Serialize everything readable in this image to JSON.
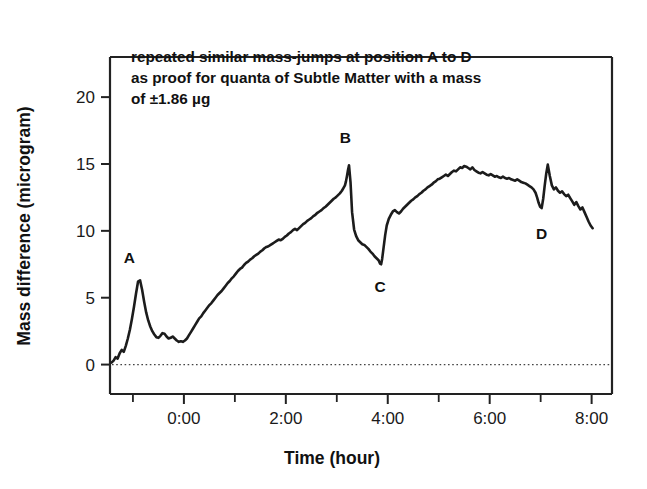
{
  "chart_data": {
    "type": "line",
    "title": "",
    "xlabel": "Time (hour)",
    "ylabel": "Mass difference (microgram)",
    "xlim": [
      -1.45,
      8.4
    ],
    "ylim": [
      -2.2,
      23.0
    ],
    "xticks": [
      0,
      1,
      2,
      3,
      4,
      5,
      6,
      7,
      8
    ],
    "xticklabels": [
      "0:00",
      "",
      "2:00",
      "",
      "4:00",
      "",
      "6:00",
      "",
      "8:00"
    ],
    "yticks": [
      0,
      5,
      10,
      15,
      20
    ],
    "yticklabels": [
      "0",
      "5",
      "10",
      "15",
      "20"
    ],
    "grid": false,
    "legend": "none",
    "zero_reference_line": 0,
    "annotations": [
      {
        "name": "note-line-1",
        "text": "repeated similar mass-jumps at position A to D"
      },
      {
        "name": "note-line-2",
        "text": "as proof for quanta of Subtle Matter with a mass"
      },
      {
        "name": "note-line-3",
        "text": "of ±1.86 µg"
      }
    ],
    "point_labels": [
      {
        "label": "A",
        "x": -1.07,
        "y": 7.6
      },
      {
        "label": "B",
        "x": 3.17,
        "y": 16.6
      },
      {
        "label": "C",
        "x": 3.85,
        "y": 5.4
      },
      {
        "label": "D",
        "x": 7.02,
        "y": 9.4
      }
    ],
    "series": [
      {
        "name": "mass difference",
        "x": [
          -1.42,
          -1.38,
          -1.34,
          -1.3,
          -1.26,
          -1.22,
          -1.18,
          -1.14,
          -1.1,
          -1.06,
          -1.02,
          -0.98,
          -0.94,
          -0.9,
          -0.86,
          -0.82,
          -0.78,
          -0.74,
          -0.7,
          -0.66,
          -0.62,
          -0.58,
          -0.54,
          -0.5,
          -0.46,
          -0.42,
          -0.38,
          -0.34,
          -0.3,
          -0.26,
          -0.22,
          -0.18,
          -0.14,
          -0.1,
          -0.06,
          -0.02,
          0.02,
          0.06,
          0.1,
          0.14,
          0.18,
          0.22,
          0.26,
          0.3,
          0.34,
          0.38,
          0.42,
          0.46,
          0.5,
          0.54,
          0.58,
          0.62,
          0.66,
          0.7,
          0.74,
          0.78,
          0.82,
          0.86,
          0.9,
          0.94,
          0.98,
          1.02,
          1.06,
          1.1,
          1.14,
          1.18,
          1.22,
          1.26,
          1.3,
          1.34,
          1.38,
          1.42,
          1.46,
          1.5,
          1.54,
          1.58,
          1.62,
          1.66,
          1.7,
          1.74,
          1.78,
          1.82,
          1.86,
          1.9,
          1.94,
          1.98,
          2.02,
          2.06,
          2.1,
          2.14,
          2.18,
          2.22,
          2.26,
          2.3,
          2.34,
          2.38,
          2.42,
          2.46,
          2.5,
          2.54,
          2.58,
          2.62,
          2.66,
          2.7,
          2.74,
          2.78,
          2.82,
          2.86,
          2.9,
          2.94,
          2.98,
          3.02,
          3.06,
          3.1,
          3.13,
          3.16,
          3.18,
          3.2,
          3.22,
          3.24,
          3.27,
          3.3,
          3.34,
          3.38,
          3.42,
          3.46,
          3.5,
          3.54,
          3.58,
          3.62,
          3.66,
          3.7,
          3.74,
          3.78,
          3.82,
          3.85,
          3.87,
          3.89,
          3.92,
          3.95,
          3.98,
          4.02,
          4.06,
          4.1,
          4.14,
          4.18,
          4.22,
          4.26,
          4.3,
          4.34,
          4.38,
          4.42,
          4.46,
          4.5,
          4.54,
          4.58,
          4.62,
          4.66,
          4.7,
          4.74,
          4.78,
          4.82,
          4.86,
          4.9,
          4.94,
          4.98,
          5.02,
          5.06,
          5.1,
          5.14,
          5.18,
          5.22,
          5.26,
          5.3,
          5.34,
          5.38,
          5.42,
          5.46,
          5.5,
          5.54,
          5.58,
          5.62,
          5.66,
          5.7,
          5.74,
          5.78,
          5.82,
          5.86,
          5.9,
          5.94,
          5.98,
          6.02,
          6.06,
          6.1,
          6.14,
          6.18,
          6.22,
          6.26,
          6.3,
          6.34,
          6.38,
          6.42,
          6.46,
          6.5,
          6.54,
          6.58,
          6.62,
          6.66,
          6.7,
          6.74,
          6.78,
          6.82,
          6.86,
          6.9,
          6.93,
          6.96,
          6.99,
          7.02,
          7.05,
          7.08,
          7.11,
          7.14,
          7.18,
          7.22,
          7.26,
          7.3,
          7.34,
          7.38,
          7.42,
          7.46,
          7.5,
          7.54,
          7.58,
          7.62,
          7.66,
          7.7,
          7.74,
          7.78,
          7.82,
          7.86,
          7.9,
          7.94,
          7.98,
          8.02
        ],
        "y": [
          0.15,
          0.3,
          0.55,
          0.45,
          0.85,
          1.1,
          0.95,
          1.4,
          1.95,
          2.6,
          3.4,
          4.3,
          5.3,
          6.2,
          6.3,
          5.6,
          4.7,
          3.9,
          3.3,
          2.85,
          2.5,
          2.25,
          2.05,
          2.0,
          2.15,
          2.35,
          2.3,
          2.1,
          1.95,
          2.0,
          2.1,
          1.95,
          1.8,
          1.7,
          1.75,
          1.7,
          1.8,
          1.95,
          2.2,
          2.45,
          2.7,
          2.95,
          3.2,
          3.45,
          3.6,
          3.85,
          4.05,
          4.25,
          4.45,
          4.6,
          4.8,
          5.0,
          5.2,
          5.35,
          5.5,
          5.7,
          5.9,
          6.1,
          6.25,
          6.45,
          6.6,
          6.8,
          7.0,
          7.15,
          7.25,
          7.45,
          7.6,
          7.7,
          7.85,
          7.95,
          8.1,
          8.2,
          8.3,
          8.45,
          8.55,
          8.7,
          8.8,
          8.85,
          8.95,
          9.05,
          9.15,
          9.25,
          9.35,
          9.3,
          9.4,
          9.55,
          9.65,
          9.8,
          9.9,
          10.05,
          10.15,
          10.05,
          10.2,
          10.35,
          10.5,
          10.6,
          10.75,
          10.85,
          10.95,
          11.1,
          11.2,
          11.35,
          11.45,
          11.55,
          11.7,
          11.8,
          11.95,
          12.1,
          12.25,
          12.4,
          12.5,
          12.65,
          12.8,
          13.0,
          13.2,
          13.4,
          13.7,
          14.1,
          14.55,
          14.9,
          13.6,
          11.4,
          10.1,
          9.6,
          9.3,
          9.15,
          9.0,
          8.95,
          8.8,
          8.65,
          8.45,
          8.3,
          8.1,
          7.95,
          7.8,
          7.55,
          7.5,
          7.9,
          8.8,
          9.7,
          10.4,
          10.9,
          11.2,
          11.45,
          11.55,
          11.4,
          11.3,
          11.45,
          11.65,
          11.8,
          11.95,
          12.1,
          12.25,
          12.35,
          12.5,
          12.6,
          12.75,
          12.85,
          13.0,
          13.1,
          13.25,
          13.35,
          13.45,
          13.6,
          13.7,
          13.85,
          13.9,
          14.0,
          14.1,
          14.2,
          14.1,
          14.25,
          14.4,
          14.5,
          14.45,
          14.6,
          14.75,
          14.7,
          14.85,
          14.8,
          14.7,
          14.6,
          14.75,
          14.55,
          14.45,
          14.35,
          14.3,
          14.4,
          14.3,
          14.2,
          14.15,
          14.25,
          14.15,
          14.05,
          14.1,
          14.0,
          13.95,
          14.05,
          13.95,
          13.9,
          13.95,
          13.85,
          13.8,
          13.75,
          13.85,
          13.75,
          13.65,
          13.6,
          13.55,
          13.45,
          13.35,
          13.25,
          13.1,
          12.85,
          12.5,
          12.1,
          11.8,
          11.7,
          12.4,
          13.4,
          14.3,
          14.95,
          14.1,
          13.4,
          13.1,
          13.25,
          13.0,
          12.85,
          12.95,
          12.75,
          12.6,
          12.7,
          12.45,
          12.2,
          11.95,
          12.15,
          11.85,
          11.6,
          11.75,
          11.4,
          11.05,
          10.7,
          10.4,
          10.2
        ]
      }
    ]
  },
  "axis": {
    "ylabel": "Mass difference (microgram)",
    "xlabel": "Time (hour)"
  }
}
